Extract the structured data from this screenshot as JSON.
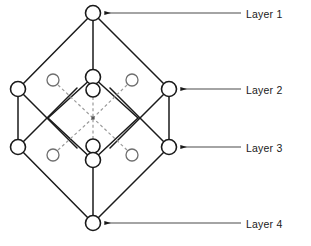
{
  "diagram": {
    "type": "layered-network-graph",
    "title": "",
    "canvas": {
      "width": 311,
      "height": 246
    },
    "colors": {
      "node_stroke": "#1a1a1a",
      "node_fill": "#ffffff",
      "solid_edge": "#1a1a1a",
      "dashed_edge": "#9a9a9a",
      "small_node_stroke": "#6e6e6e",
      "leader_line": "#4a4a4a",
      "label_text": "#1a1a1a",
      "background": "#ffffff"
    },
    "layers": [
      {
        "id": "layer-1",
        "label": "Layer 1",
        "node_count": 1,
        "nodes": [
          {
            "id": "n-top",
            "cx": 93,
            "cy": 13,
            "r": 7.5,
            "kind": "large"
          }
        ]
      },
      {
        "id": "layer-2",
        "label": "Layer 2",
        "node_count": 6,
        "nodes": [
          {
            "id": "n-l2-left",
            "cx": 18,
            "cy": 89,
            "r": 7.5,
            "kind": "large"
          },
          {
            "id": "n-l2-right",
            "cx": 169,
            "cy": 89,
            "r": 7.5,
            "kind": "large"
          },
          {
            "id": "n-l2-inner-top",
            "cx": 93,
            "cy": 77,
            "r": 7.5,
            "kind": "large"
          },
          {
            "id": "n-l2-inner-mid",
            "cx": 93,
            "cy": 90,
            "r": 7.0,
            "kind": "large"
          },
          {
            "id": "n-l2-small-left",
            "cx": 53,
            "cy": 80,
            "r": 6.0,
            "kind": "small"
          },
          {
            "id": "n-l2-small-right",
            "cx": 132,
            "cy": 80,
            "r": 6.0,
            "kind": "small"
          }
        ]
      },
      {
        "id": "layer-3",
        "label": "Layer 3",
        "node_count": 6,
        "nodes": [
          {
            "id": "n-l3-left",
            "cx": 18,
            "cy": 147,
            "r": 7.5,
            "kind": "large"
          },
          {
            "id": "n-l3-right",
            "cx": 169,
            "cy": 147,
            "r": 7.5,
            "kind": "large"
          },
          {
            "id": "n-l3-inner-mid",
            "cx": 93,
            "cy": 146,
            "r": 7.0,
            "kind": "large"
          },
          {
            "id": "n-l3-inner-bottom",
            "cx": 93,
            "cy": 160,
            "r": 7.5,
            "kind": "large"
          },
          {
            "id": "n-l3-small-left",
            "cx": 53,
            "cy": 155,
            "r": 6.0,
            "kind": "small"
          },
          {
            "id": "n-l3-small-right",
            "cx": 132,
            "cy": 155,
            "r": 6.0,
            "kind": "small"
          }
        ]
      },
      {
        "id": "layer-4",
        "label": "Layer 4",
        "node_count": 1,
        "nodes": [
          {
            "id": "n-bottom",
            "cx": 93,
            "cy": 223,
            "r": 7.5,
            "kind": "large"
          }
        ]
      }
    ],
    "center_point": {
      "cx": 93,
      "cy": 118
    },
    "solid_edges": [
      {
        "from": "n-top",
        "to": "n-l2-left",
        "x1": 93,
        "y1": 13,
        "x2": 18,
        "y2": 89
      },
      {
        "from": "n-top",
        "to": "n-l2-right",
        "x1": 93,
        "y1": 13,
        "x2": 169,
        "y2": 89
      },
      {
        "from": "n-top",
        "to": "n-l2-inner-top",
        "x1": 93,
        "y1": 13,
        "x2": 93,
        "y2": 77
      },
      {
        "from": "n-l2-inner-top",
        "to": "inner-left-vertex",
        "x1": 93,
        "y1": 77,
        "x2": 48,
        "y2": 118
      },
      {
        "from": "n-l2-inner-top",
        "to": "inner-right-vertex",
        "x1": 93,
        "y1": 77,
        "x2": 138,
        "y2": 118
      },
      {
        "from": "inner-left-vertex",
        "to": "n-l3-inner-bottom",
        "x1": 48,
        "y1": 118,
        "x2": 93,
        "y2": 160
      },
      {
        "from": "inner-right-vertex",
        "to": "n-l3-inner-bottom",
        "x1": 138,
        "y1": 118,
        "x2": 93,
        "y2": 160
      },
      {
        "from": "n-l2-left",
        "to": "n-l3-left",
        "x1": 18,
        "y1": 89,
        "x2": 18,
        "y2": 147
      },
      {
        "from": "n-l2-right",
        "to": "n-l3-right",
        "x1": 169,
        "y1": 89,
        "x2": 169,
        "y2": 147
      },
      {
        "from": "n-l2-left",
        "to": "cross-down-right",
        "x1": 18,
        "y1": 89,
        "x2": 76,
        "y2": 147
      },
      {
        "from": "n-l3-left",
        "to": "cross-up-right",
        "x1": 18,
        "y1": 147,
        "x2": 76,
        "y2": 89
      },
      {
        "from": "n-l2-right",
        "to": "cross-down-left",
        "x1": 169,
        "y1": 89,
        "x2": 111,
        "y2": 147
      },
      {
        "from": "n-l3-right",
        "to": "cross-up-left",
        "x1": 169,
        "y1": 147,
        "x2": 111,
        "y2": 89
      },
      {
        "from": "n-l3-left",
        "to": "n-bottom",
        "x1": 18,
        "y1": 147,
        "x2": 93,
        "y2": 223
      },
      {
        "from": "n-l3-right",
        "to": "n-bottom",
        "x1": 169,
        "y1": 147,
        "x2": 93,
        "y2": 223
      },
      {
        "from": "n-l3-inner-bottom",
        "to": "n-bottom",
        "x1": 93,
        "y1": 160,
        "x2": 93,
        "y2": 223
      }
    ],
    "dashed_edges": [
      {
        "from": "n-l2-small-left",
        "to": "center",
        "x1": 58,
        "y1": 85,
        "x2": 93,
        "y2": 118
      },
      {
        "from": "n-l2-small-right",
        "to": "center",
        "x1": 127,
        "y1": 85,
        "x2": 93,
        "y2": 118
      },
      {
        "from": "n-l3-small-left",
        "to": "center",
        "x1": 58,
        "y1": 150,
        "x2": 93,
        "y2": 118
      },
      {
        "from": "n-l3-small-right",
        "to": "center",
        "x1": 127,
        "y1": 150,
        "x2": 93,
        "y2": 118
      },
      {
        "from": "n-l2-inner-mid",
        "to": "center",
        "x1": 93,
        "y1": 97,
        "x2": 93,
        "y2": 118
      },
      {
        "from": "n-l3-inner-mid",
        "to": "center",
        "x1": 93,
        "y1": 139,
        "x2": 93,
        "y2": 118
      }
    ],
    "leader_lines": [
      {
        "for": "layer-1",
        "x1": 241,
        "y1": 13,
        "x2": 104,
        "y2": 13,
        "arrow": "left"
      },
      {
        "for": "layer-2",
        "x1": 241,
        "y1": 89,
        "x2": 180,
        "y2": 89,
        "arrow": "left"
      },
      {
        "for": "layer-3",
        "x1": 241,
        "y1": 147,
        "x2": 180,
        "y2": 147,
        "arrow": "left"
      },
      {
        "for": "layer-4",
        "x1": 241,
        "y1": 223,
        "x2": 104,
        "y2": 223,
        "arrow": "left"
      }
    ]
  }
}
